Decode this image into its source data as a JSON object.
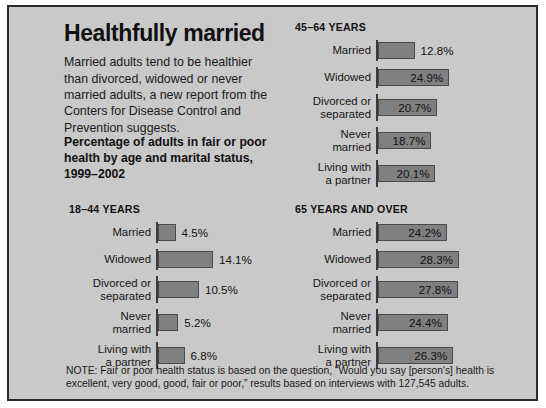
{
  "headline": "Healthfully married",
  "deck": "Married adults tend to be healthier than divorced, widowed or never married adults, a new report from the Conters for Disease Control and Prevention suggests.",
  "subhead": "Percentage of adults in fair or poor health by age and marital status, 1999–2002",
  "note": "NOTE: Fair or poor health status is based on the question, “Would you say [person's] health is excellent, very good, good, fair or poor,” results based on interviews with 127,545 adults.",
  "colors": {
    "panel_background": "#c9c9c9",
    "panel_border": "#2a2a2a",
    "bar_fill": "#808080",
    "bar_stroke": "#4a4a4a",
    "axis": "#3a3a3a",
    "text": "#101010"
  },
  "chart_data": [
    {
      "type": "bar",
      "id": "chart-45-64",
      "title": "45–64 YEARS",
      "orientation": "horizontal",
      "categories": [
        "Married",
        "Widowed",
        "Divorced or\nseparated",
        "Never\nmarried",
        "Living with\na partner"
      ],
      "values": [
        12.8,
        24.9,
        20.7,
        18.7,
        20.1
      ],
      "value_labels": [
        "12.8%",
        "24.9%",
        "20.7%",
        "18.7%",
        "20.1%"
      ],
      "label_placement": [
        "outside",
        "inside",
        "inside",
        "inside",
        "inside"
      ],
      "xlabel": "",
      "ylabel": "",
      "xlim": [
        0,
        30
      ],
      "grid": false,
      "legend": false
    },
    {
      "type": "bar",
      "id": "chart-18-44",
      "title": "18–44 YEARS",
      "orientation": "horizontal",
      "categories": [
        "Married",
        "Widowed",
        "Divorced or\nseparated",
        "Never\nmarried",
        "Living with\na partner"
      ],
      "values": [
        4.5,
        14.1,
        10.5,
        5.2,
        6.8
      ],
      "value_labels": [
        "4.5%",
        "14.1%",
        "10.5%",
        "5.2%",
        "6.8%"
      ],
      "label_placement": [
        "outside",
        "outside",
        "outside",
        "outside",
        "outside"
      ],
      "xlabel": "",
      "ylabel": "",
      "xlim": [
        0,
        30
      ],
      "grid": false,
      "legend": false
    },
    {
      "type": "bar",
      "id": "chart-65-over",
      "title": "65 YEARS AND OVER",
      "orientation": "horizontal",
      "categories": [
        "Married",
        "Widowed",
        "Divorced or\nseparated",
        "Never\nmarried",
        "Living with\na partner"
      ],
      "values": [
        24.2,
        28.3,
        27.8,
        24.4,
        26.3
      ],
      "value_labels": [
        "24.2%",
        "28.3%",
        "27.8%",
        "24.4%",
        "26.3%"
      ],
      "label_placement": [
        "inside",
        "inside",
        "inside",
        "inside",
        "inside"
      ],
      "xlabel": "",
      "ylabel": "",
      "xlim": [
        0,
        30
      ],
      "grid": false,
      "legend": false
    }
  ]
}
